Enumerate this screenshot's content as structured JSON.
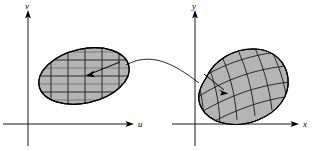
{
  "figure": {
    "background_color": "#ffffff",
    "region_fill_color": "#b4b4b4",
    "line_color": "#000000",
    "width": 314,
    "height": 151
  },
  "left_panel": {
    "name": "uv-plane",
    "vertical_axis_label": "v",
    "horizontal_axis_label": "u",
    "origin": {
      "x": 28,
      "y": 124
    },
    "vertical_axis": {
      "x": 28,
      "y_top": 12,
      "y_bottom": 146
    },
    "horizontal_axis": {
      "y": 124,
      "x_left": 3,
      "x_right": 132
    },
    "region": {
      "name": "source-region",
      "shape": "ellipse",
      "center_x": 84,
      "center_y": 76,
      "radius_x": 46,
      "radius_y": 27,
      "rotation_deg": -13,
      "grid": "rectangular",
      "grid_columns": 5,
      "grid_rows": 4
    },
    "inner_arrow": {
      "name": "source-point-arrow",
      "from_x": 118,
      "from_y": 64,
      "to_x": 86,
      "to_y": 76
    }
  },
  "right_panel": {
    "name": "xy-plane",
    "vertical_axis_label": "y",
    "horizontal_axis_label": "x",
    "origin": {
      "x": 195,
      "y": 124
    },
    "vertical_axis": {
      "x": 195,
      "y_top": 12,
      "y_bottom": 146
    },
    "horizontal_axis": {
      "y": 124,
      "x_left": 178,
      "x_right": 299
    },
    "region": {
      "name": "image-region",
      "shape": "warped-blob",
      "center_x": 242,
      "center_y": 87,
      "grid": "curvilinear",
      "grid_columns": 5,
      "grid_rows": 5
    },
    "inner_arrow": {
      "name": "image-point-arrow",
      "from_x": 206,
      "from_y": 76,
      "to_x": 228,
      "to_y": 93
    }
  },
  "mapping_curve": {
    "name": "mapping-connector",
    "from_x": 128,
    "from_y": 68,
    "to_x": 198,
    "to_y": 82,
    "style": "curved-arc"
  }
}
